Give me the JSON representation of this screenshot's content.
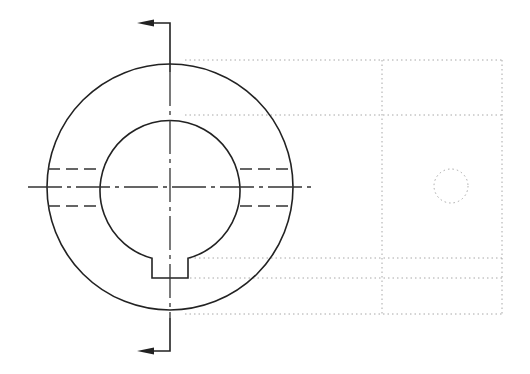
{
  "drawing": {
    "type": "technical-drawing",
    "description": "Front view of a keyed hub/washer with section cutting plane, plus faint projected side view",
    "colors": {
      "object_line": "#222222",
      "hidden_line": "#333333",
      "projection_line": "#a8a8a8",
      "background": "#ffffff"
    },
    "front_view": {
      "center": [
        170,
        187
      ],
      "outer_circle_radius": 123,
      "inner_bore_radius": 70,
      "keyway": {
        "x_left": 152,
        "x_right": 188,
        "bottom_y": 278
      },
      "hidden_lines_y": [
        169,
        206
      ],
      "centerline_horizontal": {
        "x1": 28,
        "x2": 313,
        "y": 187
      },
      "cutting_plane": {
        "x": 170,
        "top_y": 23,
        "bottom_y": 351,
        "arrow_tip_x": 137,
        "arrow_direction": "left"
      }
    },
    "side_view": {
      "projection_lines_y": [
        60,
        115,
        258,
        278,
        314
      ],
      "projection_x_start": 185,
      "frame_x": [
        382,
        502
      ],
      "small_circle": {
        "center": [
          451,
          186
        ],
        "radius": 17
      }
    }
  }
}
